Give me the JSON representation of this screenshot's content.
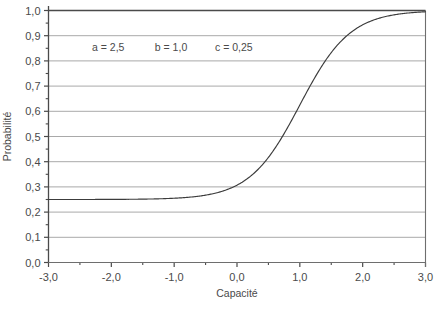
{
  "chart_data": {
    "type": "line",
    "title": "",
    "xlabel": "Capacité",
    "ylabel": "Probabilité",
    "xlim": [
      -3.0,
      3.0
    ],
    "ylim": [
      0.0,
      1.0
    ],
    "grid": "horizontal",
    "legend": "none",
    "x_ticks": [
      "-3,0",
      "-2,0",
      "-1,0",
      "0,0",
      "1,0",
      "2,0",
      "3,0"
    ],
    "x_tick_values": [
      -3.0,
      -2.0,
      -1.0,
      0.0,
      1.0,
      2.0,
      3.0
    ],
    "x_minor_ticks": [
      -2.5,
      -1.5,
      -0.5,
      0.5,
      1.5,
      2.5
    ],
    "y_ticks": [
      "0,0",
      "0,1",
      "0,2",
      "0,3",
      "0,4",
      "0,5",
      "0,6",
      "0,7",
      "0,8",
      "0,9",
      "1,0"
    ],
    "y_tick_values": [
      0.0,
      0.1,
      0.2,
      0.3,
      0.4,
      0.5,
      0.6,
      0.7,
      0.8,
      0.9,
      1.0
    ],
    "y_minor_ticks": [
      0.05,
      0.15,
      0.25,
      0.35,
      0.45,
      0.55,
      0.65,
      0.75,
      0.85,
      0.95
    ],
    "annotations": [
      {
        "label": "a = 2,5",
        "x": -2.05,
        "y": 0.855
      },
      {
        "label": "b = 1,0",
        "x": -1.05,
        "y": 0.855
      },
      {
        "label": "c = 0,25",
        "x": -0.05,
        "y": 0.855
      }
    ],
    "parameters": {
      "a": 2.5,
      "b": 1.0,
      "c": 0.25
    },
    "model": "c + (1 - c) / (1 + exp(-a * (x - b)))",
    "series": [
      {
        "name": "Courbe caractéristique",
        "color": "#3c3c3c",
        "x": [
          -3.0,
          -2.8,
          -2.6,
          -2.4,
          -2.2,
          -2.0,
          -1.8,
          -1.6,
          -1.4,
          -1.2,
          -1.0,
          -0.8,
          -0.6,
          -0.4,
          -0.2,
          0.0,
          0.2,
          0.4,
          0.6,
          0.8,
          1.0,
          1.2,
          1.4,
          1.6,
          1.8,
          2.0,
          2.2,
          2.4,
          2.6,
          2.8,
          3.0
        ],
        "values": [
          0.2504,
          0.2506,
          0.251,
          0.2516,
          0.2527,
          0.2544,
          0.2572,
          0.2618,
          0.2693,
          0.2815,
          0.3013,
          0.3324,
          0.3805,
          0.4509,
          0.546,
          0.6603,
          0.7779,
          0.8773,
          0.9436,
          0.9789,
          0.9932,
          0.9982,
          0.9996,
          0.9999,
          1.0,
          1.0,
          1.0,
          1.0,
          1.0,
          1.0,
          1.0
        ]
      }
    ]
  },
  "colors": {
    "grid": "#a9a9a9",
    "axis": "#4a4a4a",
    "frame_top": "#4a4a4a",
    "curve": "#3c3c3c",
    "text": "#4a4a4a",
    "background": "#ffffff"
  }
}
